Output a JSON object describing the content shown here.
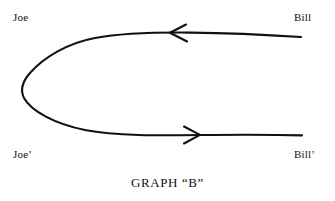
{
  "figure": {
    "caption": "GRAPH “B”",
    "background_color": "#ffffff",
    "ink_color": "#111111",
    "width": 335,
    "height": 201
  },
  "nodes": [
    {
      "id": "joe",
      "label": "Joe",
      "position": "top-left"
    },
    {
      "id": "bill",
      "label": "Bill",
      "position": "top-right"
    },
    {
      "id": "joe_prime",
      "label": "Joe’",
      "position": "bottom-left"
    },
    {
      "id": "bill_prime",
      "label": "Bill’",
      "position": "bottom-right"
    }
  ],
  "edges": [
    {
      "id": "top-edge",
      "from": "bill",
      "to": "joe",
      "direction": "leftward",
      "arrow_marker": "arrowhead-left",
      "shape": "horizontal-line-into-hairpin"
    },
    {
      "id": "bottom-edge",
      "from": "joe_prime",
      "to": "bill_prime",
      "direction": "rightward",
      "arrow_marker": "arrowhead-right",
      "shape": "hairpin-into-horizontal-line"
    }
  ],
  "connector": {
    "id": "left-hairpin",
    "description": "rounded U-turn joining the top and bottom edges at the left"
  }
}
